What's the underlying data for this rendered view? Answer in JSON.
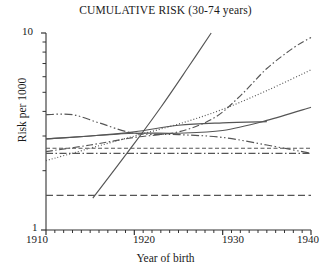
{
  "chart_data": {
    "type": "line",
    "title": "CUMULATIVE RISK (30-74 years)",
    "xlabel": "Year of birth",
    "ylabel": "Risk per 1000",
    "xlim": [
      1910,
      1940
    ],
    "ylim": [
      1,
      10
    ],
    "yscale": "log",
    "grid": false,
    "legend": "none",
    "xticks": [
      1910,
      1920,
      1930,
      1940
    ],
    "xtick_labels": [
      "1910",
      "1920",
      "1930",
      "1940"
    ],
    "yticks": [
      1,
      10
    ],
    "ytick_labels": [
      "1",
      "10"
    ],
    "yminor_ticks": [
      2,
      3,
      4,
      5,
      6,
      7,
      8,
      9
    ],
    "series": [
      {
        "name": "steep-rising-solid",
        "style": "solid",
        "x": [
          1915.3,
          1920.0,
          1923.0,
          1926.0,
          1928.7
        ],
        "y": [
          1.45,
          2.75,
          4.2,
          6.6,
          10.0
        ]
      },
      {
        "name": "dash-dot-rising-to-9.5",
        "style": "dash-dot",
        "x": [
          1910,
          1915,
          1920,
          1925,
          1929,
          1932,
          1935,
          1938,
          1940
        ],
        "y": [
          2.5,
          2.7,
          2.95,
          3.15,
          3.7,
          4.8,
          6.6,
          8.4,
          9.5
        ]
      },
      {
        "name": "dotted-rising-to-6.5",
        "style": "dotted",
        "x": [
          1910,
          1915,
          1920,
          1925,
          1930,
          1935,
          1940
        ],
        "y": [
          2.25,
          2.6,
          3.0,
          3.45,
          4.1,
          5.1,
          6.5
        ]
      },
      {
        "name": "solid-rising-to-4.2",
        "style": "solid",
        "x": [
          1910,
          1915,
          1920,
          1925,
          1930,
          1935,
          1940
        ],
        "y": [
          2.9,
          3.0,
          3.1,
          3.1,
          3.2,
          3.6,
          4.2
        ]
      },
      {
        "name": "solid-plateau-ends-1935",
        "style": "solid",
        "x": [
          1910,
          1915,
          1920,
          1925,
          1930,
          1935
        ],
        "y": [
          2.9,
          3.0,
          3.15,
          3.4,
          3.5,
          3.55
        ]
      },
      {
        "name": "dash-dot-dot-declining",
        "style": "dash-dot-dot",
        "x": [
          1910,
          1913,
          1916,
          1920,
          1925,
          1930,
          1935,
          1940
        ],
        "y": [
          3.85,
          3.85,
          3.5,
          3.1,
          3.05,
          2.95,
          2.7,
          2.45
        ]
      },
      {
        "name": "dashed-flat-2.6",
        "style": "dashed",
        "x": [
          1910,
          1940
        ],
        "y": [
          2.6,
          2.6
        ]
      },
      {
        "name": "dash-dot-flat-2.45",
        "style": "dash-dot",
        "x": [
          1910,
          1940
        ],
        "y": [
          2.45,
          2.45
        ]
      },
      {
        "name": "long-dash-flat-1.5",
        "style": "long-dash",
        "x": [
          1910,
          1940
        ],
        "y": [
          1.5,
          1.5
        ]
      }
    ]
  },
  "axes": {
    "title": "CUMULATIVE RISK (30-74 years)",
    "ylabel": "Risk per 1000",
    "xlabel": "Year of birth",
    "ytop": "10",
    "ybottom": "1",
    "x1": "1910",
    "x2": "1920",
    "x3": "1930",
    "x4": "1940"
  },
  "colors": {
    "line": "#555555",
    "axis": "#333333",
    "text": "#1a1a1a",
    "background": "#ffffff"
  }
}
